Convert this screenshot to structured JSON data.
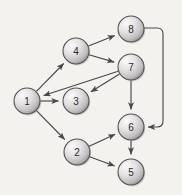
{
  "figure": {
    "background_color": "#f4f2ee",
    "width": 182,
    "height": 195
  },
  "style": {
    "node_radius": 13,
    "node_fill_light": "#f7f7f7",
    "node_fill_mid": "#d8d6d6",
    "node_fill_dark": "#9a9698",
    "node_stroke": "#555153",
    "edge_color": "#4a4749",
    "label_color": "#2e2c2d"
  },
  "chart_data": {
    "type": "diagram",
    "title": "",
    "nodes": [
      {
        "id": "1",
        "label": "1",
        "x": 27,
        "y": 101
      },
      {
        "id": "2",
        "label": "2",
        "x": 77,
        "y": 152
      },
      {
        "id": "3",
        "label": "3",
        "x": 76,
        "y": 101
      },
      {
        "id": "4",
        "label": "4",
        "x": 76,
        "y": 51
      },
      {
        "id": "5",
        "label": "5",
        "x": 131,
        "y": 172
      },
      {
        "id": "6",
        "label": "6",
        "x": 131,
        "y": 127
      },
      {
        "id": "7",
        "label": "7",
        "x": 131,
        "y": 67
      },
      {
        "id": "8",
        "label": "8",
        "x": 131,
        "y": 29
      }
    ],
    "edges": [
      {
        "from": "1",
        "to": "4",
        "directed": true,
        "shape": "straight"
      },
      {
        "from": "1",
        "to": "3",
        "directed": true,
        "shape": "straight"
      },
      {
        "from": "1",
        "to": "2",
        "directed": true,
        "shape": "straight"
      },
      {
        "from": "4",
        "to": "8",
        "directed": true,
        "shape": "straight"
      },
      {
        "from": "4",
        "to": "7",
        "directed": true,
        "shape": "straight"
      },
      {
        "from": "7",
        "to": "1",
        "directed": true,
        "shape": "straight"
      },
      {
        "from": "7",
        "to": "3",
        "directed": true,
        "shape": "straight"
      },
      {
        "from": "7",
        "to": "6",
        "directed": true,
        "shape": "straight"
      },
      {
        "from": "8",
        "to": "6",
        "directed": true,
        "shape": "orthogonal-right"
      },
      {
        "from": "2",
        "to": "6",
        "directed": true,
        "shape": "straight"
      },
      {
        "from": "2",
        "to": "5",
        "directed": true,
        "shape": "straight"
      },
      {
        "from": "6",
        "to": "5",
        "directed": true,
        "shape": "straight"
      }
    ]
  }
}
